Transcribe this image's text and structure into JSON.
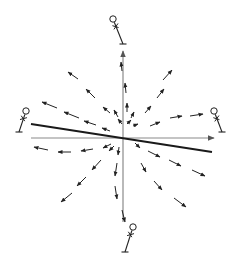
{
  "diagram": {
    "type": "vector-field",
    "origin": [
      123,
      138
    ],
    "colors": {
      "axis": "#8a8a8a",
      "arrow": "#222222",
      "tilted_line": "#1a1a1a",
      "figure": "#222222",
      "background": "#ffffff"
    },
    "axes": {
      "horizontal": {
        "from": [
          31,
          138
        ],
        "to": [
          214,
          138
        ]
      },
      "vertical": {
        "from": [
          123,
          222
        ],
        "to": [
          123,
          51
        ]
      }
    },
    "tilted_line": {
      "from": [
        31,
        124
      ],
      "to": [
        212,
        152
      ]
    },
    "observers": [
      {
        "name": "top",
        "head": [
          113,
          19
        ],
        "foot": [
          123,
          44
        ]
      },
      {
        "name": "left",
        "head": [
          26,
          111
        ],
        "foot": [
          19,
          132
        ]
      },
      {
        "name": "right",
        "head": [
          214,
          111
        ],
        "foot": [
          222,
          132
        ]
      },
      {
        "name": "bottom",
        "head": [
          133,
          227
        ],
        "foot": [
          125,
          252
        ]
      }
    ],
    "arrows": [
      [
        122,
        71,
        121,
        62
      ],
      [
        126,
        93,
        125,
        83
      ],
      [
        127,
        112,
        127,
        103
      ],
      [
        118,
        117,
        114,
        110
      ],
      [
        131,
        118,
        134,
        112
      ],
      [
        122,
        124,
        118,
        119
      ],
      [
        127,
        124,
        131,
        120
      ],
      [
        133,
        126,
        138,
        124
      ],
      [
        78,
        79,
        68,
        72
      ],
      [
        95,
        98,
        86,
        89
      ],
      [
        110,
        113,
        103,
        107
      ],
      [
        163,
        80,
        172,
        70
      ],
      [
        157,
        98,
        164,
        89
      ],
      [
        145,
        113,
        151,
        106
      ],
      [
        57,
        108,
        42,
        102
      ],
      [
        79,
        118,
        64,
        112
      ],
      [
        96,
        125,
        84,
        121
      ],
      [
        110,
        131,
        102,
        128
      ],
      [
        170,
        118,
        182,
        116
      ],
      [
        190,
        116,
        203,
        114
      ],
      [
        150,
        126,
        160,
        122
      ],
      [
        48,
        150,
        34,
        147
      ],
      [
        71,
        152,
        58,
        152
      ],
      [
        93,
        149,
        81,
        151
      ],
      [
        111,
        144,
        103,
        148
      ],
      [
        135,
        143,
        140,
        148
      ],
      [
        148,
        151,
        160,
        157
      ],
      [
        169,
        160,
        181,
        166
      ],
      [
        192,
        170,
        205,
        176
      ],
      [
        114,
        146,
        109,
        151
      ],
      [
        119,
        147,
        118,
        155
      ],
      [
        101,
        160,
        92,
        170
      ],
      [
        86,
        177,
        77,
        186
      ],
      [
        72,
        193,
        61,
        202
      ],
      [
        117,
        163,
        115,
        176
      ],
      [
        115,
        186,
        117,
        199
      ],
      [
        122,
        210,
        125,
        222
      ],
      [
        141,
        163,
        146,
        172
      ],
      [
        154,
        181,
        162,
        190
      ],
      [
        174,
        198,
        186,
        207
      ]
    ]
  }
}
